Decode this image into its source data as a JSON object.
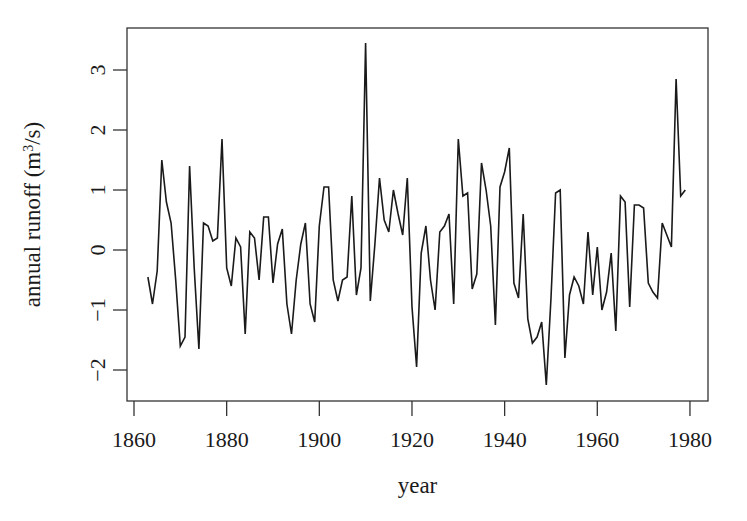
{
  "chart_data": {
    "type": "line",
    "title": "",
    "xlabel": "year",
    "ylabel": "annual runoff (m³/s)",
    "ylabel_parts": {
      "before": "annual runoff (m",
      "sup": "3",
      "after": "/s)"
    },
    "xlim": [
      1858.5,
      1984
    ],
    "ylim": [
      -2.52,
      3.7
    ],
    "x_ticks": [
      1860,
      1880,
      1900,
      1920,
      1940,
      1960,
      1980
    ],
    "x_tick_labels": [
      "1860",
      "1880",
      "1900",
      "1920",
      "1940",
      "1960",
      "1980"
    ],
    "y_ticks": [
      -2,
      -1,
      0,
      1,
      2,
      3
    ],
    "y_tick_labels": [
      "−2",
      "−1",
      "0",
      "1",
      "2",
      "3"
    ],
    "grid": false,
    "legend": null,
    "series": [
      {
        "name": "annual runoff",
        "color": "#1a1a1a",
        "x": [
          1863,
          1864,
          1865,
          1866,
          1867,
          1868,
          1869,
          1870,
          1871,
          1872,
          1873,
          1874,
          1875,
          1876,
          1877,
          1878,
          1879,
          1880,
          1881,
          1882,
          1883,
          1884,
          1885,
          1886,
          1887,
          1888,
          1889,
          1890,
          1891,
          1892,
          1893,
          1894,
          1895,
          1896,
          1897,
          1898,
          1899,
          1900,
          1901,
          1902,
          1903,
          1904,
          1905,
          1906,
          1907,
          1908,
          1909,
          1910,
          1911,
          1912,
          1913,
          1914,
          1915,
          1916,
          1917,
          1918,
          1919,
          1920,
          1921,
          1922,
          1923,
          1924,
          1925,
          1926,
          1927,
          1928,
          1929,
          1930,
          1931,
          1932,
          1933,
          1934,
          1935,
          1936,
          1937,
          1938,
          1939,
          1940,
          1941,
          1942,
          1943,
          1944,
          1945,
          1946,
          1947,
          1948,
          1949,
          1950,
          1951,
          1952,
          1953,
          1954,
          1955,
          1956,
          1957,
          1958,
          1959,
          1960,
          1961,
          1962,
          1963,
          1964,
          1965,
          1966,
          1967,
          1968,
          1969,
          1970,
          1971,
          1972,
          1973,
          1974,
          1975,
          1976,
          1977,
          1978,
          1979
        ],
        "values": [
          -0.45,
          -0.9,
          -0.35,
          1.5,
          0.8,
          0.45,
          -0.5,
          -1.6,
          -1.45,
          1.4,
          -0.3,
          -1.65,
          0.45,
          0.4,
          0.15,
          0.2,
          1.85,
          -0.3,
          -0.6,
          0.2,
          0.05,
          -1.4,
          0.3,
          0.2,
          -0.5,
          0.55,
          0.55,
          -0.55,
          0.1,
          0.35,
          -0.9,
          -1.4,
          -0.5,
          0.1,
          0.45,
          -0.9,
          -1.2,
          0.4,
          1.05,
          1.05,
          -0.5,
          -0.85,
          -0.5,
          -0.45,
          0.9,
          -0.75,
          -0.3,
          3.45,
          -0.85,
          0.1,
          1.2,
          0.5,
          0.3,
          1.0,
          0.6,
          0.25,
          1.2,
          -0.95,
          -1.95,
          -0.05,
          0.4,
          -0.5,
          -1.0,
          0.3,
          0.4,
          0.6,
          -0.9,
          1.85,
          0.9,
          0.95,
          -0.65,
          -0.4,
          1.45,
          1.0,
          0.4,
          -1.25,
          1.05,
          1.3,
          1.7,
          -0.55,
          -0.8,
          0.6,
          -1.15,
          -1.55,
          -1.45,
          -1.2,
          -2.25,
          -0.8,
          0.95,
          1.0,
          -1.8,
          -0.75,
          -0.45,
          -0.6,
          -0.9,
          0.3,
          -0.75,
          0.05,
          -1.0,
          -0.7,
          -0.05,
          -1.35,
          0.9,
          0.8,
          -0.95,
          0.75,
          0.75,
          0.7,
          -0.55,
          -0.7,
          -0.8,
          0.45,
          0.25,
          0.05,
          2.85,
          0.9,
          1.0
        ]
      }
    ]
  },
  "layout": {
    "plot_left": 127,
    "plot_top": 28,
    "plot_right": 708,
    "plot_bottom": 401,
    "x_px_per_year": 4.633,
    "x_origin_year": 1860,
    "x_origin_px": 134,
    "y_zero_px": 250,
    "y_px_per_unit": 60
  }
}
